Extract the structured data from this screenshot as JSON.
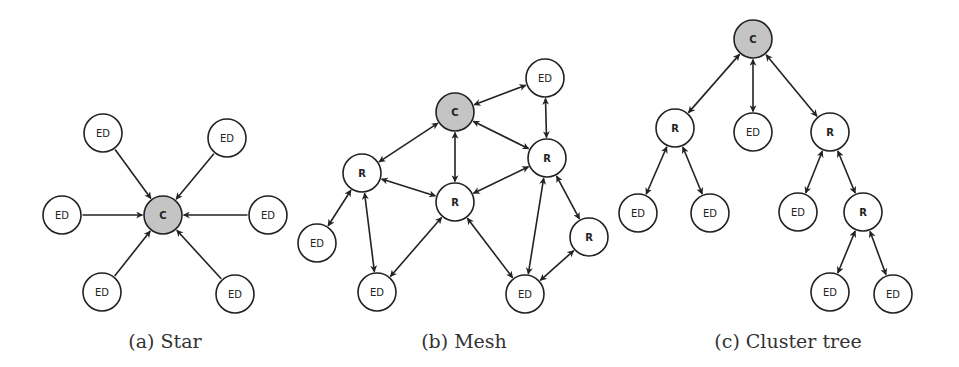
{
  "figure": {
    "node_radius": 19,
    "colors": {
      "coordinator_fill": "#c4c4c4",
      "node_fill": "#ffffff",
      "stroke": "#222222"
    },
    "legend": {
      "C": "Coordinator",
      "R": "Router",
      "ED": "End Device"
    },
    "subfigures": [
      {
        "id": "star",
        "caption": "(a) Star",
        "caption_pos": [
          165,
          342
        ],
        "nodes": [
          {
            "id": "c",
            "label": "C",
            "type": "coordinator",
            "x": 163,
            "y": 215
          },
          {
            "id": "ed1",
            "label": "ED",
            "type": "end-device",
            "x": 103,
            "y": 133
          },
          {
            "id": "ed2",
            "label": "ED",
            "type": "end-device",
            "x": 227,
            "y": 138
          },
          {
            "id": "ed3",
            "label": "ED",
            "type": "end-device",
            "x": 62,
            "y": 215
          },
          {
            "id": "ed4",
            "label": "ED",
            "type": "end-device",
            "x": 268,
            "y": 215
          },
          {
            "id": "ed5",
            "label": "ED",
            "type": "end-device",
            "x": 102,
            "y": 292
          },
          {
            "id": "ed6",
            "label": "ED",
            "type": "end-device",
            "x": 235,
            "y": 294
          }
        ],
        "edges": [
          {
            "from": "ed1",
            "to": "c",
            "dir": "forward"
          },
          {
            "from": "ed2",
            "to": "c",
            "dir": "forward"
          },
          {
            "from": "ed3",
            "to": "c",
            "dir": "forward"
          },
          {
            "from": "ed4",
            "to": "c",
            "dir": "forward"
          },
          {
            "from": "ed5",
            "to": "c",
            "dir": "forward"
          },
          {
            "from": "ed6",
            "to": "c",
            "dir": "forward"
          }
        ]
      },
      {
        "id": "mesh",
        "caption": "(b) Mesh",
        "caption_pos": [
          464,
          342
        ],
        "nodes": [
          {
            "id": "c",
            "label": "C",
            "type": "coordinator",
            "x": 455,
            "y": 112
          },
          {
            "id": "ed1",
            "label": "ED",
            "type": "end-device",
            "x": 545,
            "y": 78
          },
          {
            "id": "r1",
            "label": "R",
            "type": "router",
            "x": 547,
            "y": 158
          },
          {
            "id": "r2",
            "label": "R",
            "type": "router",
            "x": 362,
            "y": 173
          },
          {
            "id": "r3",
            "label": "R",
            "type": "router",
            "x": 455,
            "y": 202
          },
          {
            "id": "r4",
            "label": "R",
            "type": "router",
            "x": 589,
            "y": 237
          },
          {
            "id": "ed2",
            "label": "ED",
            "type": "end-device",
            "x": 317,
            "y": 243
          },
          {
            "id": "ed3",
            "label": "ED",
            "type": "end-device",
            "x": 377,
            "y": 292
          },
          {
            "id": "ed4",
            "label": "ED",
            "type": "end-device",
            "x": 525,
            "y": 294
          }
        ],
        "edges": [
          {
            "from": "c",
            "to": "ed1",
            "dir": "both"
          },
          {
            "from": "c",
            "to": "r2",
            "dir": "both"
          },
          {
            "from": "c",
            "to": "r3",
            "dir": "both"
          },
          {
            "from": "c",
            "to": "r1",
            "dir": "both"
          },
          {
            "from": "ed1",
            "to": "r1",
            "dir": "both"
          },
          {
            "from": "r2",
            "to": "r3",
            "dir": "both"
          },
          {
            "from": "r3",
            "to": "r1",
            "dir": "both"
          },
          {
            "from": "r2",
            "to": "ed2",
            "dir": "both"
          },
          {
            "from": "r2",
            "to": "ed3",
            "dir": "both"
          },
          {
            "from": "r3",
            "to": "ed3",
            "dir": "both"
          },
          {
            "from": "r3",
            "to": "ed4",
            "dir": "both"
          },
          {
            "from": "r1",
            "to": "ed4",
            "dir": "both"
          },
          {
            "from": "r1",
            "to": "r4",
            "dir": "both"
          },
          {
            "from": "r4",
            "to": "ed4",
            "dir": "both"
          }
        ]
      },
      {
        "id": "cluster-tree",
        "caption": "(c) Cluster tree",
        "caption_pos": [
          788,
          342
        ],
        "nodes": [
          {
            "id": "c",
            "label": "C",
            "type": "coordinator",
            "x": 753,
            "y": 39
          },
          {
            "id": "r1",
            "label": "R",
            "type": "router",
            "x": 675,
            "y": 128
          },
          {
            "id": "ed1",
            "label": "ED",
            "type": "end-device",
            "x": 753,
            "y": 132
          },
          {
            "id": "r2",
            "label": "R",
            "type": "router",
            "x": 830,
            "y": 132
          },
          {
            "id": "ed2",
            "label": "ED",
            "type": "end-device",
            "x": 638,
            "y": 213
          },
          {
            "id": "ed3",
            "label": "ED",
            "type": "end-device",
            "x": 710,
            "y": 213
          },
          {
            "id": "ed4",
            "label": "ED",
            "type": "end-device",
            "x": 798,
            "y": 212
          },
          {
            "id": "r3",
            "label": "R",
            "type": "router",
            "x": 863,
            "y": 212
          },
          {
            "id": "ed5",
            "label": "ED",
            "type": "end-device",
            "x": 830,
            "y": 292
          },
          {
            "id": "ed6",
            "label": "ED",
            "type": "end-device",
            "x": 893,
            "y": 294
          }
        ],
        "edges": [
          {
            "from": "c",
            "to": "r1",
            "dir": "both"
          },
          {
            "from": "c",
            "to": "ed1",
            "dir": "both"
          },
          {
            "from": "c",
            "to": "r2",
            "dir": "both"
          },
          {
            "from": "r1",
            "to": "ed2",
            "dir": "both"
          },
          {
            "from": "r1",
            "to": "ed3",
            "dir": "both"
          },
          {
            "from": "r2",
            "to": "ed4",
            "dir": "both"
          },
          {
            "from": "r2",
            "to": "r3",
            "dir": "both"
          },
          {
            "from": "r3",
            "to": "ed5",
            "dir": "both"
          },
          {
            "from": "r3",
            "to": "ed6",
            "dir": "both"
          }
        ]
      }
    ]
  }
}
